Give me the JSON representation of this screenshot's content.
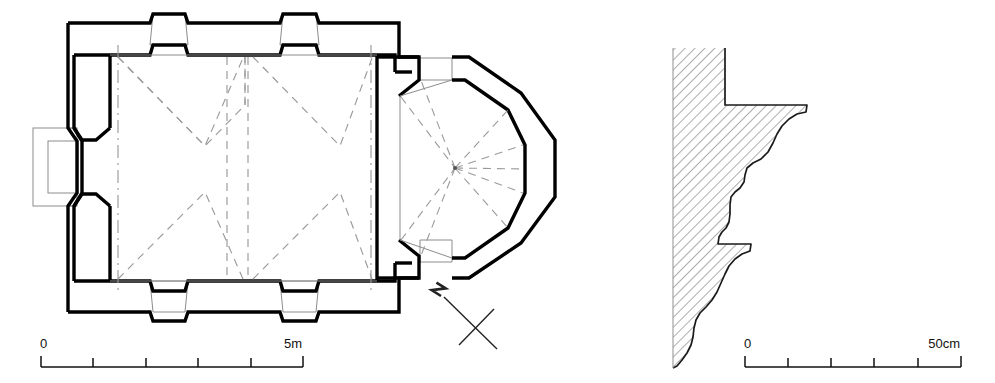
{
  "drawing": {
    "title": "Church floor plan and cornice profile",
    "ink_color": "#000000",
    "paper_color": "#ffffff",
    "hatch_color": "#6f6f6f",
    "dashed_color": "#9a9a9a"
  },
  "plan": {
    "name": "church-floor-plan",
    "description": "Rectangular two-bay nave with groin vaults, buttressed outer walls, west portal, eastern chancel bay and polygonal apse",
    "orientation_marker": "north-arrow"
  },
  "north_arrow": {
    "label": "N",
    "name": "north-arrow"
  },
  "scale_plan": {
    "name": "plan-scale-bar",
    "start_label": "0",
    "end_label": "5m",
    "divisions": 5,
    "unit": "m",
    "total": 5
  },
  "scale_profile": {
    "name": "profile-scale-bar",
    "start_label": "0",
    "end_label": "50cm",
    "divisions": 5,
    "unit": "cm",
    "total": 50
  },
  "profile": {
    "name": "cornice-profile",
    "description": "Vertical section through wall showing two moulded cornice bands, wall shown with diagonal hatching",
    "bands": 2
  }
}
